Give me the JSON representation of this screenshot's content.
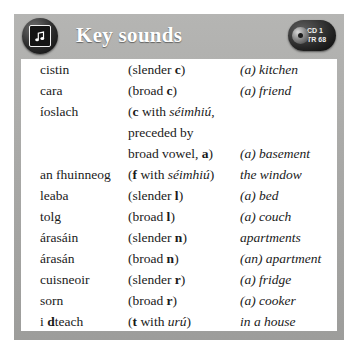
{
  "header": {
    "title": "Key sounds",
    "note_icon": "music-note-icon",
    "cd_line1": "CD 1",
    "cd_line2": "TR 68",
    "bar_color": "#a9a9a7",
    "title_color": "#ffffff"
  },
  "table": {
    "rows": [
      {
        "word": "cistin",
        "rule_pre": "(slender ",
        "rule_bold": "c",
        "rule_post": ")",
        "gloss": "(a) kitchen"
      },
      {
        "word": "cara",
        "rule_pre": "(broad ",
        "rule_bold": "c",
        "rule_post": ")",
        "gloss": "(a) friend"
      },
      {
        "word": "íoslach",
        "rule_pre": "(",
        "rule_bold": "c",
        "rule_post": " with ",
        "rule_italic": "séimhiú",
        "rule_tail": ",",
        "rule_line2": "preceded by",
        "rule_line3_pre": "broad vowel, ",
        "rule_line3_bold": "a",
        "rule_line3_post": ")",
        "gloss": "(a) basement",
        "gloss_offset_lines": 2
      },
      {
        "word": "an fhuinneog",
        "rule_pre": "(",
        "rule_bold": "f",
        "rule_post": " with ",
        "rule_italic": "séimhiú",
        "rule_tail": ")",
        "gloss": "the window"
      },
      {
        "word": "leaba",
        "rule_pre": "(slender ",
        "rule_bold": "l",
        "rule_post": ")",
        "gloss": "(a) bed"
      },
      {
        "word": "tolg",
        "rule_pre": "(broad ",
        "rule_bold": "l",
        "rule_post": ")",
        "gloss": "(a) couch"
      },
      {
        "word": "árasáin",
        "rule_pre": "(slender ",
        "rule_bold": "n",
        "rule_post": ")",
        "gloss": "apartments"
      },
      {
        "word": "árasán",
        "rule_pre": "(broad ",
        "rule_bold": "n",
        "rule_post": ")",
        "gloss": "(an) apartment"
      },
      {
        "word": "cuisneoir",
        "rule_pre": "(slender ",
        "rule_bold": "r",
        "rule_post": ")",
        "gloss": "(a) fridge"
      },
      {
        "word": "sorn",
        "rule_pre": "(broad ",
        "rule_bold": "r",
        "rule_post": ")",
        "gloss": "(a) cooker"
      },
      {
        "word_pre": "i ",
        "word_bold": "d",
        "word_post": "teach",
        "word": "i dteach",
        "rule_pre": "(",
        "rule_bold": "t",
        "rule_post": " with ",
        "rule_italic": "urú",
        "rule_tail": ")",
        "gloss": "in a house"
      }
    ]
  }
}
